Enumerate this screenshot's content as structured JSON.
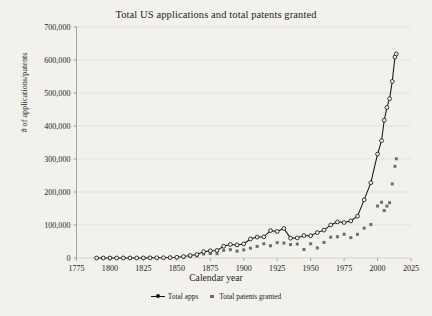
{
  "figure": {
    "background_color": "#f3f1ec",
    "title": "Total US applications and total patents granted"
  },
  "legend": {
    "position": "bottom-center",
    "items": [
      {
        "label": "Total apps",
        "marker": "line-with-circle",
        "color": "#161513"
      },
      {
        "label": "Total patents granted",
        "marker": "square",
        "color": "#6f6d6a"
      }
    ]
  },
  "chart_data": {
    "type": "line",
    "title": "Total US applications and total patents granted",
    "xlabel": "Calendar year",
    "ylabel": "# of applications/patents",
    "xlim": [
      1775,
      2025
    ],
    "ylim": [
      0,
      700000
    ],
    "grid": true,
    "grid_axis": "y",
    "xticks": [
      1775,
      1800,
      1825,
      1850,
      1875,
      1900,
      1925,
      1950,
      1975,
      2000,
      2025
    ],
    "xtick_labels": [
      "1775",
      "1800",
      "1825",
      "1850",
      "1875",
      "1900",
      "1925",
      "1950",
      "1975",
      "2000",
      "2025"
    ],
    "yticks": [
      0,
      100000,
      200000,
      300000,
      400000,
      500000,
      600000,
      700000
    ],
    "ytick_labels": [
      "0",
      "100,000",
      "200,000",
      "300,000",
      "400,000",
      "500,000",
      "600,000",
      "700,000"
    ],
    "series": [
      {
        "name": "Total apps",
        "color": "#161513",
        "marker": "circle-open",
        "x": [
          1790,
          1795,
          1800,
          1805,
          1810,
          1815,
          1820,
          1825,
          1830,
          1835,
          1840,
          1845,
          1850,
          1855,
          1860,
          1865,
          1870,
          1875,
          1880,
          1885,
          1890,
          1895,
          1900,
          1905,
          1910,
          1915,
          1920,
          1925,
          1930,
          1935,
          1940,
          1945,
          1950,
          1955,
          1960,
          1965,
          1970,
          1975,
          1980,
          1985,
          1990,
          1995,
          2000,
          2003,
          2005,
          2007,
          2009,
          2011,
          2013,
          2014
        ],
        "y": [
          3,
          10,
          41,
          125,
          223,
          173,
          155,
          304,
          544,
          752,
          765,
          1246,
          2193,
          4435,
          7653,
          10664,
          19171,
          21638,
          23012,
          35717,
          41048,
          39661,
          42730,
          57679,
          63293,
          64114,
          83012,
          80377,
          89554,
          60174,
          60768,
          67847,
          67264,
          77002,
          84476,
          100150,
          109359,
          107456,
          112379,
          126788,
          176264,
          228238,
          315015,
          355418,
          417508,
          456154,
          482871,
          535188,
          609052,
          618457
        ]
      },
      {
        "name": "Total patents granted",
        "color": "#6f6d6a",
        "marker": "square",
        "x": [
          1790,
          1795,
          1800,
          1805,
          1810,
          1815,
          1820,
          1825,
          1830,
          1835,
          1840,
          1845,
          1850,
          1855,
          1860,
          1865,
          1870,
          1875,
          1880,
          1885,
          1890,
          1895,
          1900,
          1905,
          1910,
          1915,
          1920,
          1925,
          1930,
          1935,
          1940,
          1945,
          1950,
          1955,
          1960,
          1965,
          1970,
          1975,
          1980,
          1985,
          1990,
          1995,
          2000,
          2003,
          2005,
          2007,
          2009,
          2011,
          2013,
          2014
        ],
        "y": [
          3,
          12,
          41,
          57,
          223,
          173,
          155,
          304,
          544,
          752,
          473,
          502,
          883,
          1881,
          4357,
          6088,
          12137,
          13291,
          12926,
          23285,
          25313,
          20856,
          24644,
          29775,
          35141,
          43118,
          37060,
          46432,
          45226,
          40618,
          42238,
          25695,
          43040,
          30432,
          47170,
          62857,
          64429,
          71999,
          61819,
          71661,
          90365,
          101419,
          157494,
          169023,
          143806,
          157282,
          167349,
          224505,
          277835,
          300678
        ]
      }
    ],
    "annotations": [
      "Both series are near zero from 1790 until about 1860.",
      "Gradual growth through 1860-1930, applications reach roughly 90,000 by 1930.",
      "Dip during the 1930s Depression and World War II years.",
      "Steep exponential rise after 1980; applications end near 620,000 and grants near 300,000."
    ]
  }
}
